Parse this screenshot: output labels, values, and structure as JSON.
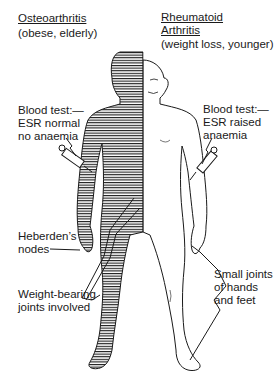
{
  "left": {
    "title": "Osteoarthritis",
    "subtitle": "(obese, elderly)",
    "blood_test": [
      "Blood test:—",
      "ESR normal",
      "no anaemia"
    ],
    "heberden": [
      "Heberden’s",
      "nodes"
    ],
    "weight_bearing": [
      "Weight-bearing",
      "joints involved"
    ]
  },
  "right": {
    "title_line1": "Rheumatoid",
    "title_line2": "Arthritis",
    "subtitle": "(weight loss, younger)",
    "blood_test": [
      "Blood test:—",
      "ESR raised",
      "anaemia"
    ],
    "small_joints": [
      "Small joints",
      "of hands",
      "and feet"
    ]
  },
  "colors": {
    "ink": "#1a1a1a",
    "background": "#ffffff"
  }
}
